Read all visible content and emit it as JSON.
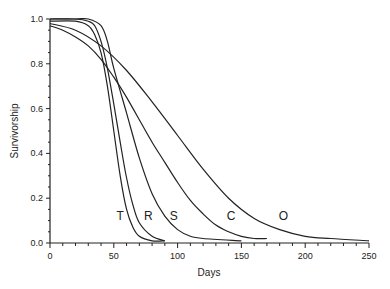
{
  "chart_data": {
    "type": "line",
    "title": "",
    "xlabel": "Days",
    "ylabel": "Survivorship",
    "xlim": [
      0,
      250
    ],
    "ylim": [
      0.0,
      1.0
    ],
    "x_ticks": [
      0,
      50,
      100,
      150,
      200,
      250
    ],
    "y_ticks": [
      0.0,
      0.2,
      0.4,
      0.6,
      0.8,
      1.0
    ],
    "y_tick_labels": [
      "0.0",
      "0.2",
      "0.4",
      "0.6",
      "0.8",
      "1.0"
    ],
    "x_tick_labels": [
      "0",
      "50",
      "100",
      "150",
      "200",
      "250"
    ],
    "grid": false,
    "legend": "inline labels",
    "series": [
      {
        "name": "T",
        "x": [
          0,
          20,
          30,
          35,
          40,
          45,
          50,
          55,
          60,
          65,
          70,
          80,
          90
        ],
        "values": [
          0.99,
          0.99,
          0.97,
          0.93,
          0.85,
          0.7,
          0.5,
          0.3,
          0.15,
          0.07,
          0.03,
          0.01,
          0.01
        ]
      },
      {
        "name": "R",
        "x": [
          0,
          20,
          30,
          35,
          40,
          45,
          50,
          55,
          60,
          65,
          70,
          80,
          90
        ],
        "values": [
          1.0,
          1.0,
          0.99,
          0.97,
          0.9,
          0.78,
          0.62,
          0.45,
          0.29,
          0.17,
          0.09,
          0.03,
          0.01
        ]
      },
      {
        "name": "S",
        "x": [
          0,
          20,
          30,
          40,
          45,
          50,
          60,
          70,
          80,
          90,
          100,
          110,
          120,
          150
        ],
        "values": [
          1.0,
          1.0,
          1.0,
          0.97,
          0.9,
          0.78,
          0.58,
          0.38,
          0.22,
          0.12,
          0.06,
          0.03,
          0.02,
          0.01
        ]
      },
      {
        "name": "C",
        "x": [
          0,
          10,
          20,
          30,
          40,
          50,
          60,
          70,
          80,
          90,
          100,
          110,
          120,
          130,
          140,
          150,
          160,
          170
        ],
        "values": [
          0.97,
          0.95,
          0.92,
          0.88,
          0.82,
          0.74,
          0.65,
          0.55,
          0.45,
          0.36,
          0.27,
          0.19,
          0.13,
          0.08,
          0.05,
          0.03,
          0.02,
          0.02
        ]
      },
      {
        "name": "O",
        "x": [
          0,
          20,
          40,
          60,
          80,
          100,
          120,
          140,
          160,
          180,
          200,
          220,
          250
        ],
        "values": [
          0.98,
          0.95,
          0.88,
          0.77,
          0.63,
          0.48,
          0.33,
          0.2,
          0.11,
          0.06,
          0.03,
          0.02,
          0.01
        ]
      }
    ],
    "annotations": [
      {
        "text": "T",
        "x": 55,
        "y": 0.12
      },
      {
        "text": "R",
        "x": 77,
        "y": 0.12
      },
      {
        "text": "S",
        "x": 97,
        "y": 0.12
      },
      {
        "text": "C",
        "x": 142,
        "y": 0.12
      },
      {
        "text": "O",
        "x": 183,
        "y": 0.12
      }
    ]
  }
}
